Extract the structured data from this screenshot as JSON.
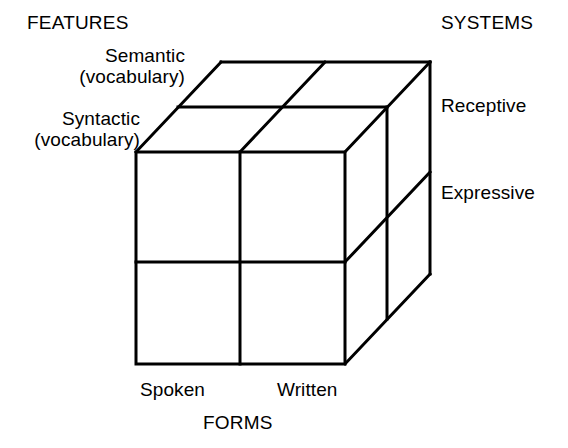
{
  "diagram": {
    "ink_color": "#000000",
    "background_color": "#ffffff",
    "stroke_width": 3
  },
  "axes": {
    "features": {
      "title": "FEATURES",
      "ticks": [
        {
          "line1": "Semantic",
          "line2": "(vocabulary)"
        },
        {
          "line1": "Syntactic",
          "line2": "(vocabulary)"
        }
      ]
    },
    "systems": {
      "title": "SYSTEMS",
      "ticks": [
        {
          "label": "Receptive"
        },
        {
          "label": "Expressive"
        }
      ]
    },
    "forms": {
      "title": "FORMS",
      "ticks": [
        {
          "label": "Spoken"
        },
        {
          "label": "Written"
        }
      ]
    }
  },
  "geometry": {
    "front_face": {
      "left": 136,
      "top": 152,
      "right": 345,
      "bottom": 364
    },
    "depth_offset": {
      "dx": 85,
      "dy": -90
    },
    "divisions": {
      "forms": 2,
      "features": 2,
      "systems": 2
    }
  }
}
